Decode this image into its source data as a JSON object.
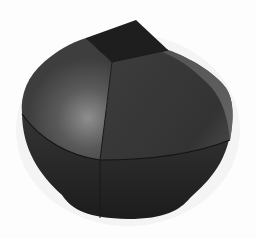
{
  "image": {
    "subject": "3D rendered rounded knob shape",
    "background_color": "#ffffff",
    "colors": {
      "top_face": "#1f1f1f",
      "upper_left_face": "#4a4a4a",
      "upper_right_face": "#3a3a3a",
      "highlight": "#8a8a8a",
      "lower_body": "#262626",
      "rim_light": "#5c5c5c",
      "seam": "#151515"
    }
  }
}
